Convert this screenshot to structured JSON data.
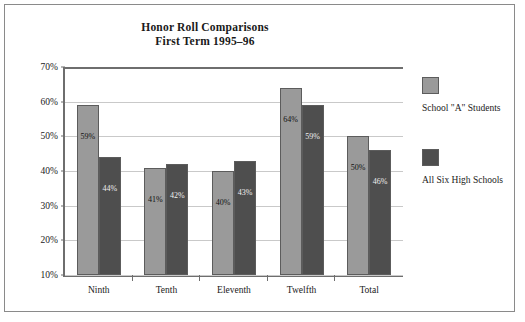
{
  "chart_data": {
    "type": "bar",
    "title": "Honor Roll Comparisons",
    "subtitle": "First Term 1995–96",
    "xlabel": "",
    "ylabel": "",
    "ylim": [
      10,
      70
    ],
    "ytick_labels": [
      "70%",
      "60%",
      "50%",
      "40%",
      "30%",
      "20%",
      "10%"
    ],
    "ytick_values": [
      70,
      60,
      50,
      40,
      30,
      20,
      10
    ],
    "grid": true,
    "legend_position": "right",
    "categories": [
      "Ninth",
      "Tenth",
      "Eleventh",
      "Twelfth",
      "Total"
    ],
    "series": [
      {
        "name": "School \"A\" Students",
        "color": "#9a9a9a",
        "values": [
          59,
          41,
          40,
          64,
          50
        ],
        "value_labels": [
          "59%",
          "41%",
          "40%",
          "64%",
          "50%"
        ]
      },
      {
        "name": "All Six High Schools",
        "color": "#4e4e4e",
        "values": [
          44,
          42,
          43,
          59,
          46
        ],
        "value_labels": [
          "44%",
          "42%",
          "43%",
          "59%",
          "46%"
        ]
      }
    ]
  }
}
